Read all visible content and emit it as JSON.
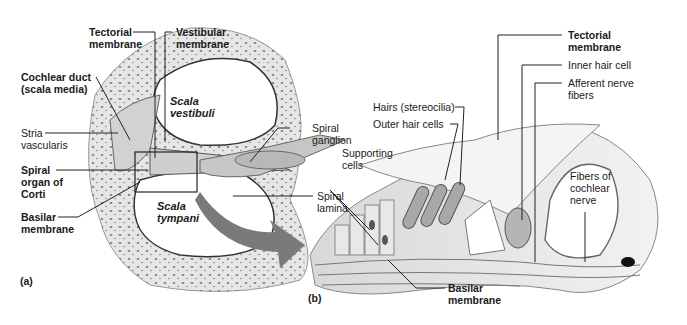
{
  "figure": {
    "panel_a": {
      "panel_label": "(a)",
      "labels": {
        "tectorial_membrane": [
          "Tectorial",
          "membrane"
        ],
        "vestibular_membrane": [
          "Vestibular",
          "membrane"
        ],
        "cochlear_duct": [
          "Cochlear duct",
          "(scala media)"
        ],
        "stria_vascularis": [
          "Stria",
          "vascularis"
        ],
        "spiral_organ": [
          "Spiral",
          "organ of",
          "Corti"
        ],
        "basilar_membrane": [
          "Basilar",
          "membrane"
        ],
        "spiral_ganglion": [
          "Spiral",
          "ganglion"
        ],
        "spiral_lamina": [
          "Spiral",
          "lamina"
        ],
        "scala_vestibuli": [
          "Scala",
          "vestibuli"
        ],
        "scala_tympani": [
          "Scala",
          "tympani"
        ]
      }
    },
    "panel_b": {
      "panel_label": "(b)",
      "labels": {
        "tectorial_membrane": [
          "Tectorial",
          "membrane"
        ],
        "inner_hair_cell": "Inner hair cell",
        "afferent_nerve_fibers": [
          "Afferent nerve",
          "fibers"
        ],
        "hairs": "Hairs (stereocilia)",
        "outer_hair_cells": "Outer hair cells",
        "supporting_cells": [
          "Supporting",
          "cells"
        ],
        "fibers_cochlear_nerve": [
          "Fibers of",
          "cochlear",
          "nerve"
        ],
        "basilar_membrane": [
          "Basilar",
          "membrane"
        ]
      }
    },
    "colors": {
      "bone": "#e4e4e4",
      "bone_dots": "#555555",
      "tissue": "#c8c8c8",
      "arrow": "#7a7a7a",
      "line": "#222222"
    }
  }
}
